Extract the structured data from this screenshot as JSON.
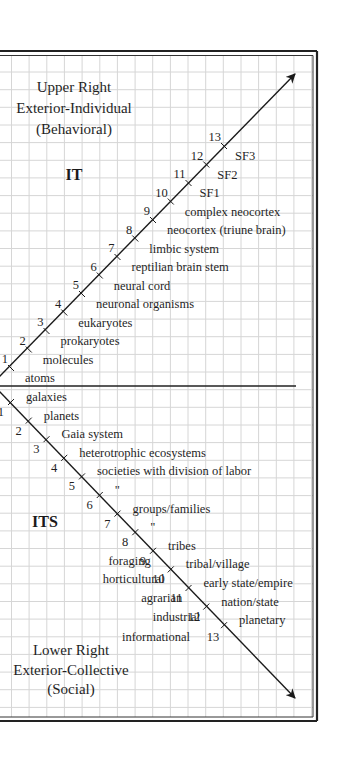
{
  "colors": {
    "background": "#ffffff",
    "grid": "#d6d6d6",
    "frame": "#222222",
    "axis": "#1a1a1a",
    "text": "#1f1f1f"
  },
  "upper_quadrant": {
    "title_lines": [
      "Upper Right",
      "Exterior-Individual",
      "(Behavioral)"
    ],
    "code": "IT",
    "ticks": [
      {
        "n": "1",
        "label": "atoms"
      },
      {
        "n": "2",
        "label": "molecules"
      },
      {
        "n": "3",
        "label": "prokaryotes"
      },
      {
        "n": "4",
        "label": "eukaryotes"
      },
      {
        "n": "5",
        "label": "neuronal organisms"
      },
      {
        "n": "6",
        "label": "neural cord"
      },
      {
        "n": "7",
        "label": "reptilian brain stem"
      },
      {
        "n": "8",
        "label": "limbic system"
      },
      {
        "n": "9",
        "label": "neocortex (triune brain)"
      },
      {
        "n": "10",
        "label": "complex neocortex"
      },
      {
        "n": "11",
        "label": "SF1"
      },
      {
        "n": "12",
        "label": "SF2"
      },
      {
        "n": "13",
        "label": "SF3"
      }
    ]
  },
  "lower_quadrant": {
    "title_lines": [
      "Lower Right",
      "Exterior-Collective",
      "(Social)"
    ],
    "code": "ITS",
    "ticks": [
      {
        "n": "1",
        "label": "galaxies",
        "left_label": ""
      },
      {
        "n": "2",
        "label": "planets",
        "left_label": ""
      },
      {
        "n": "3",
        "label": "Gaia system",
        "left_label": ""
      },
      {
        "n": "4",
        "label": "heterotrophic ecosystems",
        "left_label": ""
      },
      {
        "n": "5",
        "label": "societies with division of labor",
        "left_label": ""
      },
      {
        "n": "6",
        "label": "\"",
        "left_label": ""
      },
      {
        "n": "7",
        "label": "groups/families",
        "left_label": ""
      },
      {
        "n": "8",
        "label": "\"",
        "left_label": ""
      },
      {
        "n": "9",
        "label": "tribes",
        "left_label": ""
      },
      {
        "n": "10",
        "label": "tribal/village",
        "left_label": "foraging"
      },
      {
        "n": "11",
        "label": "early state/empire",
        "left_label": "horticultural"
      },
      {
        "n": "12",
        "label": "nation/state",
        "left_label": "agrarian"
      },
      {
        "n": "13",
        "label": "planetary",
        "left_label": "industrial"
      }
    ],
    "extra_left_label": {
      "label": "informational",
      "n": "13"
    }
  }
}
